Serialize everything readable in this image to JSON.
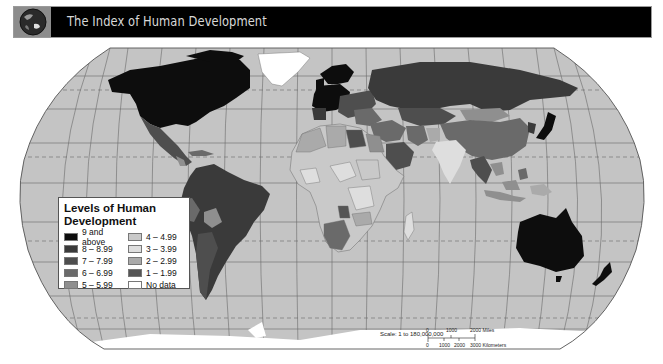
{
  "header": {
    "title": "The Index of Human Development",
    "icon": "globe-icon"
  },
  "legend": {
    "title": "Levels of Human Development",
    "items": [
      {
        "label": "9 and above",
        "color": "#0d0d0d"
      },
      {
        "label": "4 – 4.99",
        "color": "#c9c9c9"
      },
      {
        "label": "8 – 8.99",
        "color": "#3a3a3a"
      },
      {
        "label": "3 – 3.99",
        "color": "#dedede"
      },
      {
        "label": "7 – 7.99",
        "color": "#4e4e4e"
      },
      {
        "label": "2 – 2.99",
        "color": "#aaaaaa"
      },
      {
        "label": "6 – 6.99",
        "color": "#6a6a6a"
      },
      {
        "label": "1 – 1.99",
        "color": "#555555"
      },
      {
        "label": "5 – 5.99",
        "color": "#8f8f8f"
      },
      {
        "label": "No data",
        "color": "#ffffff"
      }
    ]
  },
  "scale": {
    "text": "Scale:  1 to 180,000,000",
    "miles_ticks": [
      "0",
      "1000",
      "2000 Miles"
    ],
    "km_ticks": [
      "0",
      "1000",
      "2000",
      "3000 Kilometers"
    ]
  },
  "colors": {
    "ocean": "#c4c4c4",
    "graticule": "#6a6a6a",
    "ice": "#ffffff"
  }
}
